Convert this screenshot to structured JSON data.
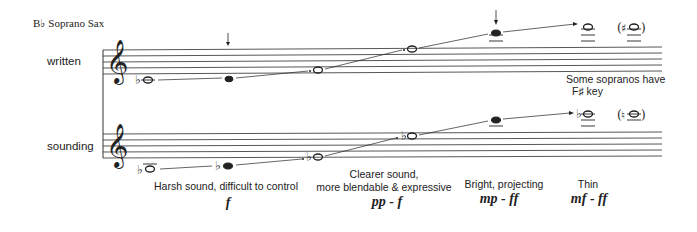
{
  "title": "B♭ Soprano Sax",
  "rows": {
    "written_label": "written",
    "sounding_label": "sounding"
  },
  "annotations": {
    "fsharp_note_line1": "Some sopranos have",
    "fsharp_note_line2": "F♯ key"
  },
  "registers": [
    {
      "description": "Harsh sound, difficult to control",
      "dynamics": "f"
    },
    {
      "description_line1": "Clearer sound,",
      "description_line2": "more blendable & expressive",
      "dynamics": "pp - f"
    },
    {
      "description": "Bright, projecting",
      "dynamics": "mp - ff"
    },
    {
      "description": "Thin",
      "dynamics": "mf - ff"
    }
  ],
  "notation": {
    "written_notes": [
      "B♭3 (lowest)",
      "C4 (break)",
      "G4",
      "F5",
      "E6 (break)",
      "F6",
      "(F♯6)"
    ],
    "sounding_notes": [
      "A♭3",
      "B♭3",
      "G♭4",
      "E♭5",
      "D6",
      "E♭6",
      "(E6)"
    ]
  }
}
